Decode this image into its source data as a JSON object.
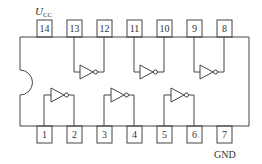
{
  "chip": {
    "vcc_label": "U",
    "vcc_sub": "CC",
    "gnd_label": "GND",
    "top_pins": [
      "14",
      "13",
      "12",
      "11",
      "10",
      "9",
      "8"
    ],
    "bottom_pins": [
      "1",
      "2",
      "3",
      "4",
      "5",
      "6",
      "7"
    ]
  }
}
